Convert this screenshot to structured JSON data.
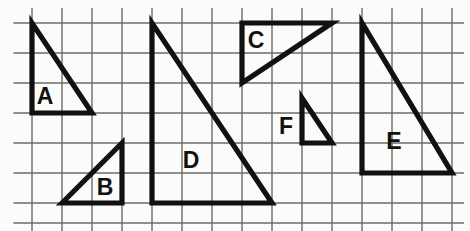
{
  "figure": {
    "background_color": "#fbfbf9",
    "grid": {
      "line_color": "#6b6b6b",
      "cell_size_px": 30,
      "origin_x": 32,
      "origin_y": 23,
      "columns": 14,
      "rows": 7,
      "vertical_line_x": [
        32,
        62,
        92,
        122,
        152,
        182,
        212,
        242,
        272,
        302,
        332,
        362,
        392,
        422,
        452
      ],
      "horizontal_line_y": [
        23,
        53,
        83,
        113,
        143,
        173,
        203,
        223
      ]
    },
    "stroke_color": "#111111",
    "stroke_width_px": 5.2,
    "triangles": [
      {
        "label": "A",
        "points": "32,23 32,113 92,113",
        "label_x": 45,
        "label_y": 98,
        "legs_cells": {
          "vertical": 3,
          "horizontal": 2
        },
        "right_angle_corner": "bottom-left"
      },
      {
        "label": "B",
        "points": "62,203 122,143 122,203",
        "label_x": 105,
        "label_y": 189,
        "legs_cells": {
          "vertical": 2,
          "horizontal": 2
        },
        "right_angle_corner": "bottom-right"
      },
      {
        "label": "C",
        "points": "242,23 332,23 242,83",
        "label_x": 256,
        "label_y": 42,
        "legs_cells": {
          "vertical": 2,
          "horizontal": 3
        },
        "right_angle_corner": "top-left"
      },
      {
        "label": "D",
        "points": "152,23 152,203 272,203",
        "label_x": 191,
        "label_y": 162,
        "legs_cells": {
          "vertical": 6,
          "horizontal": 4
        },
        "right_angle_corner": "bottom-left"
      },
      {
        "label": "E",
        "points": "362,23 362,173 452,173",
        "label_x": 394,
        "label_y": 143,
        "legs_cells": {
          "vertical": 5,
          "horizontal": 3
        },
        "right_angle_corner": "bottom-left"
      },
      {
        "label": "F",
        "points": "302,98 302,143 332,143",
        "label_x": 286,
        "label_y": 128,
        "legs_cells": {
          "vertical": 1.5,
          "horizontal": 1
        },
        "right_angle_corner": "bottom-left"
      }
    ]
  }
}
